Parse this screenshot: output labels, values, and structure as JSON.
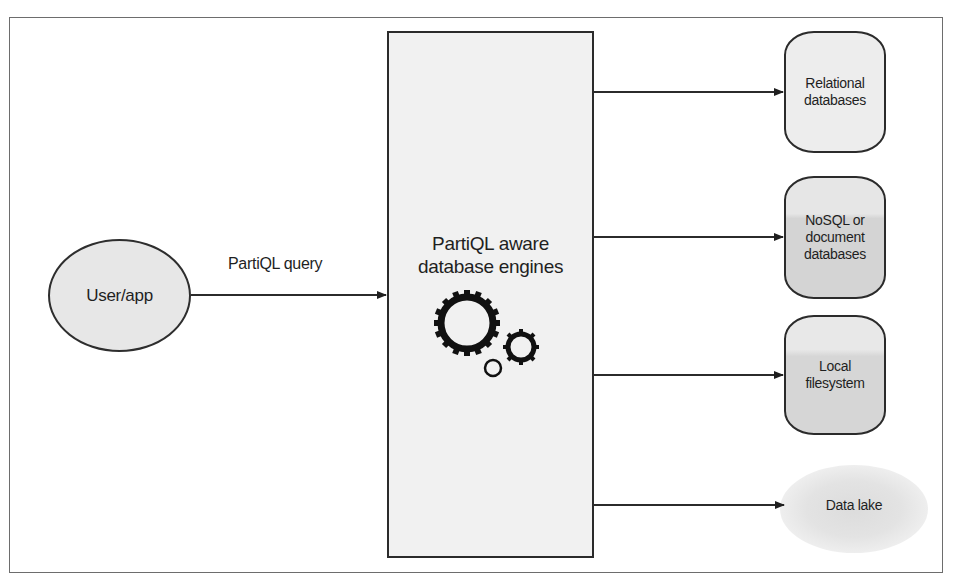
{
  "diagram": {
    "source_node": {
      "label": "User/app"
    },
    "edge_query": {
      "label": "PartiQL query"
    },
    "engine": {
      "title_line1": "PartiQL aware",
      "title_line2": "database engines",
      "icon": "gears-icon"
    },
    "targets": [
      {
        "line1": "Relational",
        "line2": "databases",
        "line3": "",
        "shape": "cylinder"
      },
      {
        "line1": "NoSQL or",
        "line2": "document",
        "line3": "databases",
        "shape": "cylinder"
      },
      {
        "line1": "Local",
        "line2": "filesystem",
        "line3": "",
        "shape": "cylinder"
      },
      {
        "line1": "Data lake",
        "shape": "cloud"
      }
    ]
  },
  "colors": {
    "stroke": "#2b2b2b",
    "fill_light": "#ededed",
    "fill_mid": "#d4d4d4",
    "frame": "#6d6d6d"
  }
}
